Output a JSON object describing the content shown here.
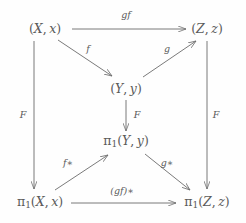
{
  "diagram": {
    "type": "commutative-diagram",
    "stroke_color": "#6b6b6b",
    "text_color": "#5a5a5a",
    "background_color": "#fefefe",
    "width": 246,
    "height": 223,
    "nodes": [
      {
        "id": "X",
        "label": "(X, x)",
        "x": 45,
        "y": 29
      },
      {
        "id": "Z",
        "label": "(Z, z)",
        "x": 207,
        "y": 29
      },
      {
        "id": "Y",
        "label": "(Y, y)",
        "x": 126,
        "y": 89
      },
      {
        "id": "piY",
        "label": "π1(Y, y)",
        "x": 126,
        "y": 142
      },
      {
        "id": "piX",
        "label": "π1(X, x)",
        "x": 40,
        "y": 203
      },
      {
        "id": "piZ",
        "label": "π1(Z, z)",
        "x": 207,
        "y": 203
      }
    ],
    "edges": [
      {
        "id": "gf",
        "from": "X",
        "to": "Z",
        "label": "gf",
        "label_x": 126,
        "label_y": 15
      },
      {
        "id": "f",
        "from": "X",
        "to": "Y",
        "label": "f",
        "label_x": 88,
        "label_y": 49
      },
      {
        "id": "g",
        "from": "Y",
        "to": "Z",
        "label": "g",
        "label_x": 167,
        "label_y": 49
      },
      {
        "id": "F-left",
        "from": "X",
        "to": "piX",
        "label": "F",
        "label_x": 23,
        "label_y": 115
      },
      {
        "id": "F-center",
        "from": "Y",
        "to": "piY",
        "label": "F",
        "label_x": 137,
        "label_y": 115
      },
      {
        "id": "F-right",
        "from": "Z",
        "to": "piZ",
        "label": "F",
        "label_x": 216,
        "label_y": 115
      },
      {
        "id": "f-star",
        "from": "piX",
        "to": "piY",
        "label": "f∗",
        "label_x": 68,
        "label_y": 163
      },
      {
        "id": "g-star",
        "from": "piY",
        "to": "piZ",
        "label": "g∗",
        "label_x": 167,
        "label_y": 163
      },
      {
        "id": "gf-star",
        "from": "piX",
        "to": "piZ",
        "label": "(gf)∗",
        "label_x": 122,
        "label_y": 191
      }
    ]
  }
}
